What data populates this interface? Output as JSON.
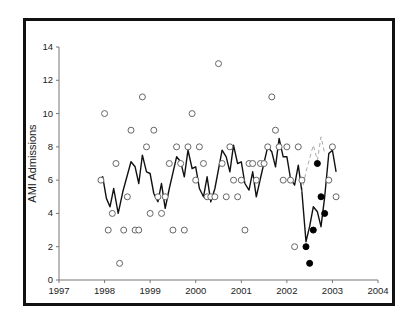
{
  "chart_data": {
    "type": "scatter",
    "title": "",
    "xlabel": "",
    "ylabel": "AMI Admissions",
    "xlim": [
      1997,
      2004
    ],
    "ylim": [
      0,
      14
    ],
    "x_ticks": [
      "1997",
      "1998",
      "1999",
      "2000",
      "2001",
      "2002",
      "2003",
      "2004"
    ],
    "y_ticks": [
      "0",
      "2",
      "4",
      "6",
      "8",
      "10",
      "12",
      "14"
    ],
    "grid": false,
    "legend": null,
    "series": [
      {
        "name": "Observed monthly admissions (pre-intervention)",
        "marker": "open-circle",
        "points": [
          [
            1997.92,
            6
          ],
          [
            1998.0,
            10
          ],
          [
            1998.08,
            3
          ],
          [
            1998.17,
            4
          ],
          [
            1998.25,
            7
          ],
          [
            1998.33,
            1
          ],
          [
            1998.42,
            3
          ],
          [
            1998.5,
            5
          ],
          [
            1998.58,
            9
          ],
          [
            1998.67,
            3
          ],
          [
            1998.75,
            3
          ],
          [
            1998.83,
            11
          ],
          [
            1998.92,
            8
          ],
          [
            1999.0,
            4
          ],
          [
            1999.08,
            9
          ],
          [
            1999.17,
            5
          ],
          [
            1999.25,
            4
          ],
          [
            1999.33,
            5
          ],
          [
            1999.42,
            7
          ],
          [
            1999.5,
            3
          ],
          [
            1999.58,
            8
          ],
          [
            1999.67,
            7
          ],
          [
            1999.75,
            3
          ],
          [
            1999.83,
            8
          ],
          [
            1999.92,
            10
          ],
          [
            2000.0,
            6
          ],
          [
            2000.08,
            8
          ],
          [
            2000.17,
            7
          ],
          [
            2000.25,
            5
          ],
          [
            2000.33,
            5
          ],
          [
            2000.42,
            5
          ],
          [
            2000.5,
            13
          ],
          [
            2000.58,
            7
          ],
          [
            2000.67,
            5
          ],
          [
            2000.75,
            8
          ],
          [
            2000.83,
            6
          ],
          [
            2000.92,
            5
          ],
          [
            2001.0,
            6
          ],
          [
            2001.08,
            3
          ],
          [
            2001.17,
            7
          ],
          [
            2001.25,
            7
          ],
          [
            2001.33,
            6
          ],
          [
            2001.42,
            7
          ],
          [
            2001.5,
            7
          ],
          [
            2001.58,
            8
          ],
          [
            2001.67,
            11
          ],
          [
            2001.75,
            9
          ],
          [
            2001.83,
            8
          ],
          [
            2001.92,
            6
          ],
          [
            2002.0,
            8
          ],
          [
            2002.08,
            6
          ],
          [
            2002.17,
            2
          ],
          [
            2002.25,
            8
          ],
          [
            2002.33,
            6
          ],
          [
            2002.92,
            6
          ],
          [
            2003.0,
            8
          ],
          [
            2003.08,
            5
          ]
        ]
      },
      {
        "name": "Observed monthly admissions (intervention period)",
        "marker": "filled-circle",
        "points": [
          [
            2002.42,
            2
          ],
          [
            2002.5,
            1
          ],
          [
            2002.58,
            3
          ],
          [
            2002.67,
            7
          ],
          [
            2002.75,
            5
          ],
          [
            2002.83,
            4
          ]
        ]
      },
      {
        "name": "Moving average / fitted",
        "style": "solid-line",
        "points": [
          [
            1997.92,
            6.1
          ],
          [
            1997.96,
            6.2
          ],
          [
            1998.04,
            4.9
          ],
          [
            1998.12,
            4.4
          ],
          [
            1998.2,
            5.5
          ],
          [
            1998.3,
            4.0
          ],
          [
            1998.4,
            5.3
          ],
          [
            1998.58,
            7.1
          ],
          [
            1998.67,
            6.8
          ],
          [
            1998.75,
            5.8
          ],
          [
            1998.83,
            7.5
          ],
          [
            1998.92,
            6.5
          ],
          [
            1999.0,
            6.4
          ],
          [
            1999.08,
            5.2
          ],
          [
            1999.17,
            4.7
          ],
          [
            1999.25,
            5.8
          ],
          [
            1999.33,
            4.3
          ],
          [
            1999.42,
            5.5
          ],
          [
            1999.58,
            7.4
          ],
          [
            1999.67,
            7.1
          ],
          [
            1999.75,
            6.2
          ],
          [
            1999.83,
            7.8
          ],
          [
            1999.92,
            6.7
          ],
          [
            2000.0,
            6.8
          ],
          [
            2000.08,
            5.5
          ],
          [
            2000.17,
            5.0
          ],
          [
            2000.25,
            6.2
          ],
          [
            2000.33,
            4.7
          ],
          [
            2000.42,
            5.5
          ],
          [
            2000.58,
            7.8
          ],
          [
            2000.67,
            7.4
          ],
          [
            2000.75,
            6.5
          ],
          [
            2000.83,
            8.1
          ],
          [
            2000.92,
            7.0
          ],
          [
            2001.0,
            7.1
          ],
          [
            2001.08,
            5.8
          ],
          [
            2001.17,
            5.4
          ],
          [
            2001.25,
            6.5
          ],
          [
            2001.33,
            5.0
          ],
          [
            2001.42,
            6.1
          ],
          [
            2001.58,
            8.0
          ],
          [
            2001.67,
            7.7
          ],
          [
            2001.75,
            6.8
          ],
          [
            2001.83,
            8.5
          ],
          [
            2001.92,
            7.4
          ],
          [
            2002.0,
            7.4
          ],
          [
            2002.08,
            6.1
          ],
          [
            2002.17,
            5.7
          ],
          [
            2002.25,
            6.9
          ],
          [
            2002.33,
            5.3
          ],
          [
            2002.42,
            2.3
          ],
          [
            2002.5,
            3.2
          ],
          [
            2002.58,
            4.4
          ],
          [
            2002.67,
            4.1
          ],
          [
            2002.75,
            3.2
          ],
          [
            2002.83,
            5.0
          ],
          [
            2002.92,
            7.6
          ],
          [
            2003.0,
            7.8
          ],
          [
            2003.08,
            6.5
          ]
        ]
      },
      {
        "name": "Expected (no intervention)",
        "style": "dashed-line-gray",
        "points": [
          [
            2002.33,
            5.3
          ],
          [
            2002.42,
            6.5
          ],
          [
            2002.58,
            8.1
          ],
          [
            2002.67,
            7.2
          ],
          [
            2002.75,
            8.6
          ],
          [
            2002.83,
            7.6
          ]
        ]
      }
    ]
  }
}
